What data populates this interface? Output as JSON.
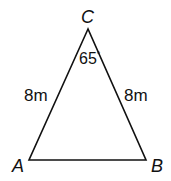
{
  "figure": {
    "type": "isosceles-triangle",
    "vertices": {
      "A": {
        "label": "A"
      },
      "B": {
        "label": "B"
      },
      "C": {
        "label": "C"
      }
    },
    "sides": {
      "AC": {
        "label": "8m"
      },
      "BC": {
        "label": "8m"
      }
    },
    "angles": {
      "C": {
        "value": "65",
        "unit": "°"
      }
    },
    "colors": {
      "stroke": "#111111",
      "background": "#ffffff"
    }
  }
}
